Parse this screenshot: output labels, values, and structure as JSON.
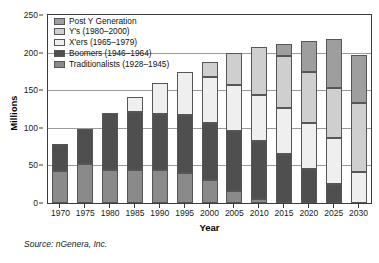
{
  "chart_data": {
    "type": "bar",
    "stacked": true,
    "title": "",
    "xlabel": "Year",
    "ylabel": "Millions",
    "ylim": [
      0,
      250
    ],
    "yticks": [
      0,
      50,
      100,
      150,
      200,
      250
    ],
    "grid": true,
    "legend_position": "top-left",
    "categories": [
      "1970",
      "1975",
      "1980",
      "1985",
      "1990",
      "1995",
      "2000",
      "2005",
      "2010",
      "2015",
      "2020",
      "2025",
      "2030"
    ],
    "series": [
      {
        "name": "Traditionalists (1928–1945)",
        "color": "#8a8a8a",
        "values": [
          43,
          52,
          44,
          44,
          44,
          40,
          30,
          16,
          6,
          0,
          0,
          0,
          0
        ]
      },
      {
        "name": "Boomers (1946–1964)",
        "color": "#4f4f4f",
        "values": [
          35,
          46,
          76,
          77,
          75,
          77,
          76,
          80,
          76,
          65,
          45,
          25,
          0
        ]
      },
      {
        "name": "X'ers (1965–1979)",
        "color": "#efefef",
        "values": [
          0,
          0,
          0,
          20,
          40,
          57,
          61,
          61,
          62,
          62,
          61,
          61,
          41
        ]
      },
      {
        "name": "Y's (1980–2000)",
        "color": "#cfcfcf",
        "values": [
          0,
          0,
          0,
          0,
          0,
          0,
          20,
          42,
          64,
          68,
          68,
          67,
          92
        ]
      },
      {
        "name": "Post Y Generation",
        "color": "#9e9e9e",
        "values": [
          0,
          0,
          0,
          0,
          0,
          0,
          0,
          0,
          0,
          17,
          42,
          65,
          64
        ]
      }
    ],
    "totals": [
      78,
      98,
      120,
      141,
      159,
      174,
      187,
      199,
      208,
      212,
      216,
      218,
      197
    ]
  },
  "legend": {
    "items": [
      {
        "label": "Post Y Generation",
        "color": "#9e9e9e"
      },
      {
        "label": "Y's (1980–2000)",
        "color": "#cfcfcf"
      },
      {
        "label": "X'ers (1965–1979)",
        "color": "#efefef"
      },
      {
        "label": "Boomers (1946–1964)",
        "color": "#4f4f4f"
      },
      {
        "label": "Traditionalists (1928–1945)",
        "color": "#8a8a8a"
      }
    ]
  },
  "axes": {
    "y_label": "Millions",
    "y_ticks": [
      "250",
      "200",
      "150",
      "100",
      "50",
      "0"
    ],
    "x_label": "Year",
    "x_ticks": [
      "1970",
      "1975",
      "1980",
      "1985",
      "1990",
      "1995",
      "2000",
      "2005",
      "2010",
      "2015",
      "2020",
      "2025",
      "2030"
    ]
  },
  "footer": {
    "source": "Source: nGenera, Inc."
  }
}
